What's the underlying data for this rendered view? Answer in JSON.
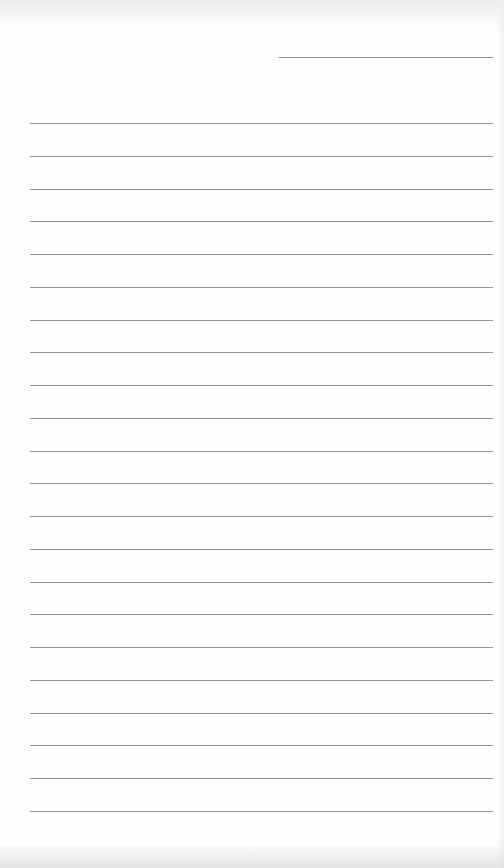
{
  "page": {
    "type": "blank lined notepad sheet",
    "background_color": "#fefefe",
    "line_color": "#939393",
    "date_line": {
      "present": true,
      "text": ""
    },
    "ruled_line_count": 22,
    "lines": [
      "",
      "",
      "",
      "",
      "",
      "",
      "",
      "",
      "",
      "",
      "",
      "",
      "",
      "",
      "",
      "",
      "",
      "",
      "",
      "",
      "",
      ""
    ]
  }
}
